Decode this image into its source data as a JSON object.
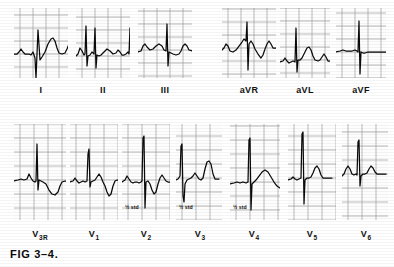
{
  "figure": {
    "caption": "FIG 3–4.",
    "kind": "12-lead electrocardiogram plate",
    "grid_color": "#9a9a9a",
    "grid_major_color": "#6f6f6f",
    "trace_color": "#0a0a0a",
    "paper_color": "#fdfdfd"
  },
  "rows": [
    {
      "name": "limb-and-augmented-leads",
      "panels": [
        {
          "id": "I",
          "label": "I",
          "sub": "",
          "x": 14,
          "y": 8,
          "w": 54,
          "h": 70,
          "note": "",
          "note_x": 0,
          "note_y": 0,
          "label_x": 14,
          "label_y": 86,
          "label_w": 54
        },
        {
          "id": "II",
          "label": "II",
          "sub": "",
          "x": 76,
          "y": 8,
          "w": 54,
          "h": 70,
          "note": "",
          "note_x": 0,
          "note_y": 0,
          "label_x": 76,
          "label_y": 86,
          "label_w": 54
        },
        {
          "id": "III",
          "label": "III",
          "sub": "",
          "x": 138,
          "y": 8,
          "w": 54,
          "h": 70,
          "note": "",
          "note_x": 0,
          "note_y": 0,
          "label_x": 138,
          "label_y": 86,
          "label_w": 54
        },
        {
          "id": "aVR",
          "label": "aVR",
          "sub": "",
          "x": 222,
          "y": 8,
          "w": 54,
          "h": 70,
          "note": "",
          "note_x": 0,
          "note_y": 0,
          "label_x": 222,
          "label_y": 86,
          "label_w": 54
        },
        {
          "id": "aVL",
          "label": "aVL",
          "sub": "",
          "x": 280,
          "y": 8,
          "w": 50,
          "h": 70,
          "note": "",
          "note_x": 0,
          "note_y": 0,
          "label_x": 278,
          "label_y": 86,
          "label_w": 54
        },
        {
          "id": "aVF",
          "label": "aVF",
          "sub": "",
          "x": 336,
          "y": 8,
          "w": 50,
          "h": 70,
          "note": "",
          "note_x": 0,
          "note_y": 0,
          "label_x": 334,
          "label_y": 86,
          "label_w": 54
        }
      ]
    },
    {
      "name": "precordial-leads",
      "panels": [
        {
          "id": "V3R",
          "label": "V",
          "sub": "3R",
          "x": 14,
          "y": 124,
          "w": 52,
          "h": 96,
          "note": "",
          "note_x": 0,
          "note_y": 0,
          "label_x": 14,
          "label_y": 230,
          "label_w": 52
        },
        {
          "id": "V1",
          "label": "V",
          "sub": "1",
          "x": 70,
          "y": 124,
          "w": 48,
          "h": 96,
          "note": "",
          "note_x": 0,
          "note_y": 0,
          "label_x": 68,
          "label_y": 230,
          "label_w": 52
        },
        {
          "id": "V2",
          "label": "V",
          "sub": "2",
          "x": 122,
          "y": 124,
          "w": 48,
          "h": 96,
          "note": "½ std",
          "note_x": 125,
          "note_y": 205,
          "label_x": 120,
          "label_y": 230,
          "label_w": 52
        },
        {
          "id": "V3",
          "label": "V",
          "sub": "3",
          "x": 176,
          "y": 124,
          "w": 46,
          "h": 96,
          "note": "½ std",
          "note_x": 179,
          "note_y": 205,
          "label_x": 174,
          "label_y": 230,
          "label_w": 52
        },
        {
          "id": "V4",
          "label": "V",
          "sub": "4",
          "x": 230,
          "y": 124,
          "w": 50,
          "h": 96,
          "note": "½ std",
          "note_x": 233,
          "note_y": 205,
          "label_x": 228,
          "label_y": 230,
          "label_w": 52
        },
        {
          "id": "V5",
          "label": "V",
          "sub": "5",
          "x": 288,
          "y": 124,
          "w": 48,
          "h": 96,
          "note": "",
          "note_x": 0,
          "note_y": 0,
          "label_x": 286,
          "label_y": 230,
          "label_w": 52
        },
        {
          "id": "V6",
          "label": "V",
          "sub": "6",
          "x": 342,
          "y": 124,
          "w": 46,
          "h": 96,
          "note": "",
          "note_x": 0,
          "note_y": 0,
          "label_x": 340,
          "label_y": 230,
          "label_w": 52
        }
      ]
    }
  ],
  "traces": {
    "I": {
      "baseline": 46,
      "grid_step": 13,
      "path": "M0,46 L3,46 L5,44 L7,41 L9,44 L11,46 L15,46 L17,47 L19,44 L21,50 L22,70 L24,22 L26,52 L28,49 L31,44 L34,36 L37,31 L39,30 L41,33 L43,40 L45,45 L48,46 L51,45 L53,41 L55,36 L57,39 L59,44 L61,46 L64,46"
    },
    "II": {
      "baseline": 48,
      "grid_step": 13,
      "path": "M0,48 L2,46 L4,40 L6,43 L8,47 L9,46 L10,18 L11,58 L12,48 L14,47 L16,44 L18,46 L19,20 L20,60 L21,47 L23,48 L25,47 L28,44 L31,41 L34,43 L37,46 L40,45 L42,42 L44,44 L46,47 L48,47 L50,46 L52,44 L53,46 L54,20 L55,62 L56,48 L58,47 L60,46 L62,46"
    },
    "III": {
      "baseline": 42,
      "grid_step": 13,
      "path": "M0,44 L3,43 L5,38 L7,36 L9,39 L12,42 L15,41 L18,38 L21,36 L24,38 L26,42 L28,43 L29,16 L30,58 L31,44 L33,45 L35,46 L38,47 L41,46 L43,43 L45,38 L47,36 L49,38 L51,42 L54,43 L57,43 L60,43"
    },
    "aVR": {
      "baseline": 40,
      "grid_step": 13,
      "path": "M0,42 L2,40 L4,36 L6,38 L8,43 L11,44 L14,42 L17,38 L20,34 L22,31 L24,33 L25,14 L26,62 L27,36 L29,33 L31,36 L33,41 L36,46 L39,50 L41,47 L43,41 L45,36 L47,33 L49,36 L51,40 L54,40 L57,39 L60,39"
    },
    "aVL": {
      "baseline": 52,
      "grid_step": 13,
      "path": "M0,54 L3,53 L5,50 L7,53 L9,55 L11,54 L13,53 L15,54 L16,20 L17,64 L18,52 L20,52 L22,50 L25,44 L27,40 L29,39 L31,42 L33,48 L35,52 L38,53 L40,52 L42,49 L44,46 L46,49 L48,53 L51,53 L54,53 L57,53"
    },
    "aVF": {
      "baseline": 44,
      "grid_step": 13,
      "path": "M0,44 L4,43 L7,42 L10,43 L13,43 L16,43 L19,42 L21,43 L22,44 L23,13 L24,66 L25,44 L27,45 L29,45 L32,44 L35,44 L38,44 L41,44 L44,44 L47,44 L50,44"
    },
    "V3R": {
      "baseline": 56,
      "grid_step": 14,
      "path": "M0,57 L4,56 L7,55 L10,56 L13,55 L15,50 L17,54 L19,57 L21,58 L22,57 L23,20 L24,66 L25,56 L27,57 L29,58 L32,60 L35,66 L38,70 L41,71 L44,68 L46,62 L48,58 L51,57 L54,57 L57,57"
    },
    "V1": {
      "baseline": 56,
      "grid_step": 14,
      "path": "M0,58 L3,57 L5,54 L7,57 L9,59 L11,58 L13,57 L15,58 L17,57 L18,30 L19,25 L20,63 L21,58 L23,57 L25,56 L27,53 L29,50 L31,53 L33,58 L35,62 L37,68 L39,72 L41,70 L43,62 L45,57 L47,56 L50,56"
    },
    "V2": {
      "baseline": 56,
      "grid_step": 14,
      "path": "M0,58 L3,56 L5,52 L7,55 L9,58 L11,59 L13,58 L15,58 L17,59 L19,58 L20,57 L21,14 L22,12 L23,84 L24,58 L26,57 L28,60 L30,66 L32,70 L34,68 L36,60 L38,54 L40,51 L42,54 L44,57 L46,58 L48,58"
    },
    "V3": {
      "baseline": 54,
      "grid_step": 14,
      "path": "M0,56 L2,55 L4,52 L5,22 L6,20 L7,72 L8,78 L9,60 L11,56 L13,55 L15,54 L17,52 L19,49 L21,52 L23,55 L25,56 L27,54 L29,45 L31,38 L33,37 L35,40 L37,50 L39,55 L41,55 L43,55"
    },
    "V4": {
      "baseline": 58,
      "grid_step": 14,
      "path": "M0,60 L4,59 L7,58 L10,59 L13,58 L16,59 L18,58 L19,16 L20,14 L21,86 L22,60 L24,58 L26,56 L29,52 L32,48 L35,46 L38,48 L41,53 L44,58 L47,62 L50,64"
    },
    "V5": {
      "baseline": 54,
      "grid_step": 14,
      "path": "M0,56 L3,55 L5,53 L7,55 L9,56 L11,55 L13,54 L14,10 L15,8 L16,80 L17,56 L19,54 L21,54 L23,53 L25,49 L27,44 L29,42 L31,45 L33,51 L35,54 L38,54 L41,54 L44,54"
    },
    "V6": {
      "baseline": 50,
      "grid_step": 14,
      "path": "M0,52 L2,50 L4,45 L6,42 L8,45 L10,50 L12,51 L14,50 L15,51 L16,18 L17,16 L18,62 L19,52 L21,50 L23,50 L25,49 L27,45 L29,42 L31,44 L33,48 L35,50 L38,50 L41,50 L44,50"
    }
  }
}
